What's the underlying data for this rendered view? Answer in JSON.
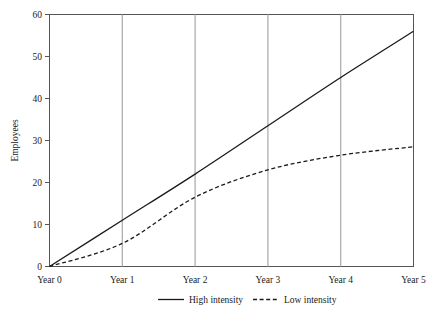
{
  "chart_data": {
    "type": "line",
    "title": "",
    "xlabel": "",
    "ylabel": "Employees",
    "x": [
      "Year 0",
      "Year 1",
      "Year 2",
      "Year 3",
      "Year 4",
      "Year 5"
    ],
    "x_numeric": [
      0,
      1,
      2,
      3,
      4,
      5
    ],
    "xlim": [
      0,
      5
    ],
    "ylim": [
      0,
      60
    ],
    "yticks": [
      0,
      10,
      20,
      30,
      40,
      50,
      60
    ],
    "ytick_labels": [
      "0",
      "10",
      "20",
      "30",
      "40",
      "50",
      "60"
    ],
    "grid": "vertical",
    "grid_color": "#a8a8a8",
    "legend_position": "bottom",
    "series": [
      {
        "name": "High intensity",
        "style": "solid",
        "color": "#1a1a1a",
        "values": [
          0,
          11,
          22,
          33.5,
          45,
          56
        ]
      },
      {
        "name": "Low intensity",
        "style": "dashed",
        "color": "#1a1a1a",
        "values": [
          0,
          5.5,
          16.5,
          23,
          26.5,
          28.5
        ]
      }
    ]
  },
  "axis": {
    "y_label": "Employees",
    "y_ticks": [
      "0",
      "10",
      "20",
      "30",
      "40",
      "50",
      "60"
    ],
    "x_ticks": [
      "Year 0",
      "Year 1",
      "Year 2",
      "Year 3",
      "Year 4",
      "Year 5"
    ]
  },
  "legend": {
    "items": [
      {
        "label": "High intensity",
        "style": "solid"
      },
      {
        "label": "Low intensity",
        "style": "dashed"
      }
    ]
  }
}
